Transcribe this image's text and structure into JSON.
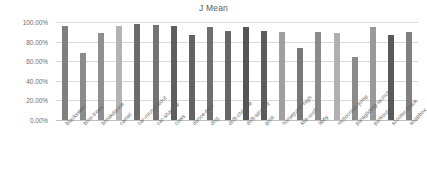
{
  "chart_data": {
    "type": "bar",
    "title": "J Mean",
    "xlabel": "",
    "ylabel": "",
    "ylim": [
      0,
      1.0
    ],
    "grid": true,
    "legend": "none",
    "y_tick_labels": [
      "100.00%",
      "80.00%",
      "60.00%",
      "40.00%",
      "20.00%",
      "0.00%"
    ],
    "y_tick_values": [
      1.0,
      0.8,
      0.6,
      0.4,
      0.2,
      0.0
    ],
    "categories": [
      "blackswan",
      "bmx-trees",
      "breakdance",
      "camel",
      "car-roundabout",
      "car-shadow",
      "cows",
      "dance-twirl",
      "dog",
      "drift-chicane",
      "drift-straight",
      "goat",
      "horsejump-high",
      "kite-surf",
      "libby",
      "motocross-jump",
      "paragliding-launch",
      "parkour",
      "scooter-black",
      "soapbox"
    ],
    "values": [
      0.962,
      0.679,
      0.893,
      0.959,
      0.982,
      0.973,
      0.959,
      0.87,
      0.953,
      0.908,
      0.945,
      0.913,
      0.897,
      0.731,
      0.897,
      0.888,
      0.647,
      0.95,
      0.869,
      0.901
    ],
    "bar_colors": [
      "#7f7f7f",
      "#8c8c8c",
      "#8f8f8f",
      "#b3b3b3",
      "#6b6b6b",
      "#737373",
      "#5e5e5e",
      "#636363",
      "#6e6e6e",
      "#666666",
      "#555555",
      "#5c5c5c",
      "#a0a0a0",
      "#787878",
      "#8a8a8a",
      "#b0b0b0",
      "#8b8b8b",
      "#9a9a9a",
      "#5a5a5a",
      "#808080"
    ],
    "axis_color": "#bfbfbf",
    "grid_color": "#d9d9d9",
    "text_color": "#5f5f5f",
    "plot_background": "#ffffff"
  }
}
